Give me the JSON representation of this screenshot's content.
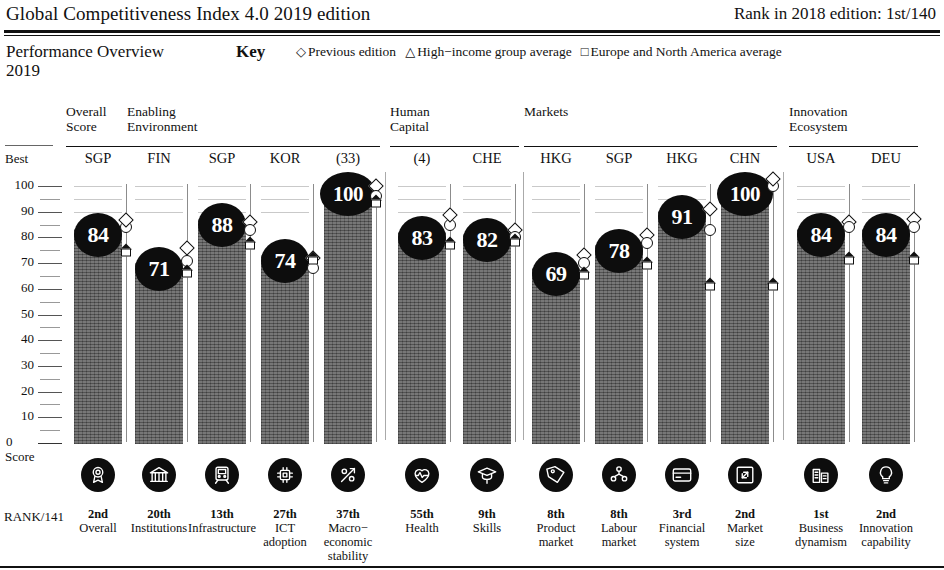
{
  "header": {
    "title": "Global Competitiveness Index 4.0 2019 edition",
    "rank_label": "Rank in 2018 edition:  1st/140"
  },
  "key": {
    "section_title_line1": "Performance Overview",
    "section_title_line2": "2019",
    "key_word": "Key",
    "items": [
      {
        "glyph": "◇",
        "label": "Previous edition"
      },
      {
        "glyph": "△",
        "label": "High−income group average"
      },
      {
        "glyph": "□",
        "label": "Europe and North America average"
      }
    ]
  },
  "axis": {
    "best_label": "Best",
    "zero_label": "0",
    "score_label": "Score",
    "rank_row_label": "RANK/141",
    "ticks": [
      "100",
      "90",
      "80",
      "70",
      "60",
      "50",
      "40",
      "30",
      "20",
      "10"
    ],
    "ymin": 0,
    "ymax": 100
  },
  "groups": [
    {
      "name": "Overall\nScore",
      "line1": "Overall",
      "line2": "Score",
      "start": 0,
      "count": 1
    },
    {
      "name": "Enabling Environment",
      "line1": "Enabling",
      "line2": "Environment",
      "start": 1,
      "count": 4
    },
    {
      "name": "Human Capital",
      "line1": "Human",
      "line2": "Capital",
      "start": 5,
      "count": 2
    },
    {
      "name": "Markets",
      "line1": "Markets",
      "line2": "",
      "start": 7,
      "count": 4
    },
    {
      "name": "Innovation Ecosystem",
      "line1": "Innovation",
      "line2": "Ecosystem",
      "start": 11,
      "count": 2
    }
  ],
  "chart_data": {
    "type": "bar",
    "ylabel": "Score",
    "ylim": [
      0,
      100
    ],
    "grid": true,
    "legend": [
      "Previous edition",
      "High−income group average",
      "Europe and North America average"
    ],
    "legend_position": "top",
    "categories": [
      "Overall",
      "Institutions",
      "Infrastructure",
      "ICT adoption",
      "Macro−economic stability",
      "Health",
      "Skills",
      "Product market",
      "Labour market",
      "Financial system",
      "Market size",
      "Business dynamism",
      "Innovation capability"
    ],
    "values": [
      84,
      71,
      88,
      74,
      100,
      83,
      82,
      69,
      78,
      91,
      100,
      84,
      84
    ],
    "best_performer": [
      "SGP",
      "FIN",
      "SGP",
      "KOR",
      "(33)",
      "(4)",
      "CHE",
      "HKG",
      "SGP",
      "HKG",
      "CHN",
      "USA",
      "DEU"
    ],
    "ranks": [
      "2nd",
      "20th",
      "13th",
      "27th",
      "37th",
      "55th",
      "9th",
      "8th",
      "8th",
      "3rd",
      "2nd",
      "1st",
      "2nd"
    ],
    "series": [
      {
        "name": "Previous edition",
        "values": [
          84,
          76,
          86,
          72,
          100,
          86,
          83,
          73,
          81,
          91,
          100,
          86,
          87
        ]
      },
      {
        "name": "High−income group average",
        "values": [
          84,
          71,
          83,
          68,
          96,
          85,
          80,
          70,
          78,
          83,
          100,
          84,
          84
        ]
      },
      {
        "name": "Europe and North America average",
        "values": [
          75,
          67,
          78,
          72,
          94,
          78,
          79,
          66,
          70,
          62,
          62,
          72,
          72
        ]
      }
    ]
  },
  "columns": [
    {
      "code": "SGP",
      "score": "84",
      "rank": "2nd",
      "pillar_lines": [
        "Overall"
      ],
      "icon": "award-icon",
      "prev": 84,
      "hi": 84,
      "ena": 75
    },
    {
      "code": "FIN",
      "score": "71",
      "rank": "20th",
      "pillar_lines": [
        "Institutions"
      ],
      "icon": "bank-icon",
      "prev": 76,
      "hi": 71,
      "ena": 67
    },
    {
      "code": "SGP",
      "score": "88",
      "rank": "13th",
      "pillar_lines": [
        "Infrastructure"
      ],
      "icon": "train-icon",
      "prev": 86,
      "hi": 83,
      "ena": 78
    },
    {
      "code": "KOR",
      "score": "74",
      "rank": "27th",
      "pillar_lines": [
        "ICT",
        "adoption"
      ],
      "icon": "chip-icon",
      "prev": 72,
      "hi": 68,
      "ena": 72
    },
    {
      "code": "(33)",
      "score": "100",
      "rank": "37th",
      "pillar_lines": [
        "Macro−",
        "economic",
        "stability"
      ],
      "icon": "percent-chart-icon",
      "prev": 100,
      "hi": 96,
      "ena": 94
    },
    {
      "code": "(4)",
      "score": "83",
      "rank": "55th",
      "pillar_lines": [
        "Health"
      ],
      "icon": "heart-pulse-icon",
      "prev": 86,
      "hi": 85,
      "ena": 78
    },
    {
      "code": "CHE",
      "score": "82",
      "rank": "9th",
      "pillar_lines": [
        "Skills"
      ],
      "icon": "graduate-icon",
      "prev": 83,
      "hi": 80,
      "ena": 79
    },
    {
      "code": "HKG",
      "score": "69",
      "rank": "8th",
      "pillar_lines": [
        "Product",
        "market"
      ],
      "icon": "price-tag-icon",
      "prev": 73,
      "hi": 70,
      "ena": 66
    },
    {
      "code": "SGP",
      "score": "78",
      "rank": "8th",
      "pillar_lines": [
        "Labour",
        "market"
      ],
      "icon": "people-icon",
      "prev": 81,
      "hi": 78,
      "ena": 70
    },
    {
      "code": "HKG",
      "score": "91",
      "rank": "3rd",
      "pillar_lines": [
        "Financial",
        "system"
      ],
      "icon": "credit-card-icon",
      "prev": 91,
      "hi": 83,
      "ena": 62
    },
    {
      "code": "CHN",
      "score": "100",
      "rank": "2nd",
      "pillar_lines": [
        "Market",
        "size"
      ],
      "icon": "expand-icon",
      "prev": 100,
      "hi": 100,
      "ena": 62
    },
    {
      "code": "USA",
      "score": "84",
      "rank": "1st",
      "pillar_lines": [
        "Business",
        "dynamism"
      ],
      "icon": "buildings-icon",
      "prev": 86,
      "hi": 84,
      "ena": 72
    },
    {
      "code": "DEU",
      "score": "84",
      "rank": "2nd",
      "pillar_lines": [
        "Innovation",
        "capability"
      ],
      "icon": "bulb-icon",
      "prev": 87,
      "hi": 84,
      "ena": 72
    }
  ],
  "colors": {
    "bar": "#5d5d5d",
    "bubble": "#0d0d0d",
    "icon_bg": "#0d0d0d",
    "text": "#111111",
    "grid": "#999999"
  }
}
